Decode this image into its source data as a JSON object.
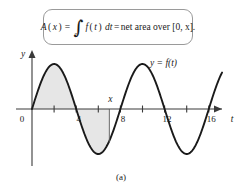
{
  "figure": {
    "caption": "(a)",
    "formula": {
      "lhs_func": "A",
      "lhs_open": "(",
      "lhs_var": "x",
      "lhs_close": ")",
      "equals_1": "=",
      "integral_glyph": "∫",
      "integral_upper": "x",
      "integral_lower": "0",
      "integrand_func": "f",
      "integrand_open": "(",
      "integrand_var": "t",
      "integrand_close": ")",
      "differential": "dt",
      "equals_2": "=",
      "rhs_text": "net area over [0, x].",
      "plain": "A(x) = ∫ from 0 to x of f(t) dt = net area over [0, x]."
    }
  },
  "chart_data": {
    "type": "line",
    "title": "",
    "subtitle": "",
    "xlabel": "t",
    "ylabel": "y",
    "curve_label": "y = f(t)",
    "x_var_label": "x",
    "origin_label": "0",
    "xlim": [
      -1.2,
      17.6
    ],
    "ylim": [
      -1.55,
      1.55
    ],
    "grid": false,
    "legend": "none",
    "x_ticks_major": [
      4,
      8,
      12,
      16
    ],
    "x_tick_labels": [
      "4",
      "8",
      "12",
      "16"
    ],
    "x_ticks_minor": [
      2,
      6,
      10,
      14
    ],
    "y_ticks": [],
    "function_description": "sine wave, amplitude 1, period 8, zero at t=0 rising",
    "amplitude": 1,
    "period": 8,
    "phase": 0,
    "zeros": [
      0,
      4,
      8,
      12,
      16
    ],
    "maxima_x": [
      2,
      10
    ],
    "minima_x": [
      6,
      14
    ],
    "curve_x_start": 0,
    "curve_x_end": 17.2,
    "shade_from": 0,
    "shade_to": 7,
    "shade_color": "#e6e6e6",
    "curve_color": "#1a1a1a",
    "axis_color": "#3a3a3a",
    "x_marker_value": 7,
    "series": [
      {
        "name": "y = f(t)",
        "x": [
          0,
          0.5,
          1,
          1.5,
          2,
          2.5,
          3,
          3.5,
          4,
          4.5,
          5,
          5.5,
          6,
          6.5,
          7,
          7.5,
          8,
          8.5,
          9,
          9.5,
          10,
          10.5,
          11,
          11.5,
          12,
          12.5,
          13,
          13.5,
          14,
          14.5,
          15,
          15.5,
          16,
          16.5,
          17,
          17.2
        ],
        "values": [
          0,
          0.383,
          0.707,
          0.924,
          1,
          0.924,
          0.707,
          0.383,
          0,
          -0.383,
          -0.707,
          -0.924,
          -1,
          -0.924,
          -0.707,
          -0.383,
          0,
          0.383,
          0.707,
          0.924,
          1,
          0.924,
          0.707,
          0.383,
          0,
          -0.383,
          -0.707,
          -0.924,
          -1,
          -0.924,
          -0.707,
          -0.383,
          0,
          0.383,
          0.707,
          0.79
        ]
      }
    ]
  }
}
